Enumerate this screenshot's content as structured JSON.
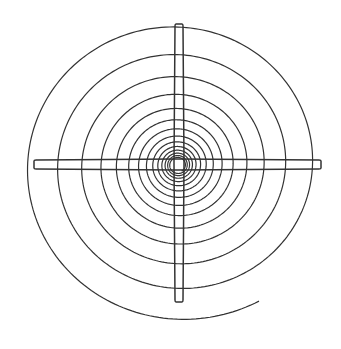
{
  "figure": {
    "title": "",
    "width": 341,
    "height": 349,
    "background": "#ffffff",
    "stroke_color": "#333333",
    "stroke_width": 1.2,
    "spiral": {
      "center": [
        178,
        165
      ],
      "start_angle_deg": 60,
      "start_radius": 162,
      "radius_ratio_per_turn": 0.8,
      "vertical_scale": 0.97,
      "turns": 14,
      "min_radius": 4,
      "tail_end": [
        221,
        324
      ]
    },
    "crosshair": {
      "vertical_bar": {
        "x_center": 179,
        "top": 24,
        "bottom": 302,
        "width_mid": 10,
        "width_end": 8
      },
      "horizontal_bar": {
        "y_center": 164.5,
        "left": 34,
        "right": 321,
        "width_mid": 11,
        "width_end": 9
      },
      "center_gap": 8
    }
  }
}
